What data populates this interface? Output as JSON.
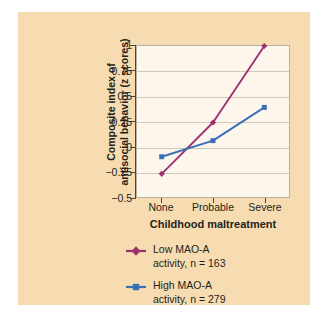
{
  "figure": {
    "background_color": "#f6dcb0",
    "plot_background_color": "#fdf6ec",
    "plot_border_color": "#b9b2a4",
    "gridline_color": "#cfc8bb"
  },
  "chart_data": {
    "type": "line",
    "title": "",
    "subtitle": "",
    "xlabel": "Childhood maltreatment",
    "ylabel": "Composite index of antisocial behavior (z scores)",
    "ylabel_line1": "Composite index of",
    "ylabel_line2": "antisocial behavior (z scores)",
    "categories": [
      "None",
      "Probable",
      "Severe"
    ],
    "ylim": [
      -0.5,
      1
    ],
    "yticks": [
      1,
      0.75,
      0.5,
      0.25,
      0,
      -0.25,
      -0.5
    ],
    "ytick_labels": [
      "1",
      "0.75",
      "0.5",
      "0.25",
      "0",
      "−0.25",
      "−0.5"
    ],
    "grid": true,
    "grid_axis": "y",
    "legend_position": "below",
    "series": [
      {
        "name": "Low MAO-A activity, n = 163",
        "label_line1": "Low MAO-A",
        "label_line2": "activity, n = 163",
        "color": "#9e3070",
        "marker": "diamond",
        "values": [
          -0.27,
          0.24,
          1.0
        ]
      },
      {
        "name": "High MAO-A activity, n = 279",
        "label_line1": "High MAO-A",
        "label_line2": "activity, n = 279",
        "color": "#3b6fb6",
        "marker": "square",
        "values": [
          -0.1,
          0.06,
          0.39
        ]
      }
    ]
  }
}
